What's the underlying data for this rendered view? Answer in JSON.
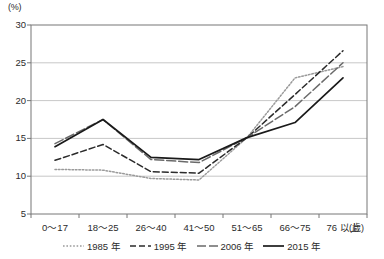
{
  "chart_data": {
    "type": "line",
    "title": "",
    "subtitle": "",
    "xlabel": "",
    "ylabel": "(%)",
    "y_unit_label": "(%)",
    "x_unit_label": "(歳)",
    "categories": [
      "0〜17",
      "18〜25",
      "26〜40",
      "41〜50",
      "51〜65",
      "66〜75",
      "76 以上"
    ],
    "ylim": [
      5,
      30
    ],
    "y_ticks": [
      5,
      10,
      15,
      20,
      25,
      30
    ],
    "grid": true,
    "legend_position": "bottom-center",
    "series": [
      {
        "name": "1985 年",
        "style": "dotted",
        "color": "#9a9a9a",
        "values": [
          10.9,
          10.8,
          9.7,
          9.5,
          15.1,
          23.0,
          24.5
        ]
      },
      {
        "name": "1995 年",
        "style": "dashed",
        "color": "#2b2b2b",
        "values": [
          12.1,
          14.2,
          10.6,
          10.4,
          15.1,
          20.8,
          26.6
        ]
      },
      {
        "name": "2006 年",
        "style": "dash-dot",
        "color": "#6a6a6a",
        "values": [
          14.3,
          17.5,
          12.2,
          11.8,
          15.1,
          19.2,
          25.0
        ]
      },
      {
        "name": "2015 年",
        "style": "solid",
        "color": "#1a1a1a",
        "values": [
          13.9,
          17.5,
          12.5,
          12.2,
          15.1,
          17.1,
          23.0
        ]
      }
    ]
  }
}
